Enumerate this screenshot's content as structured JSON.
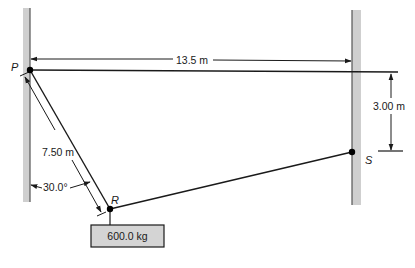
{
  "diagram": {
    "type": "statics-cable-system",
    "points": {
      "P": {
        "label": "P"
      },
      "R": {
        "label": "R"
      },
      "S": {
        "label": "S"
      }
    },
    "dimensions": {
      "wall_separation": "13.5 m",
      "vertical_offset": "3.00 m",
      "segment_PR_length": "7.50 m",
      "angle_PR_from_wall": "30.0°"
    },
    "mass": {
      "label": "600.0 kg"
    },
    "colors": {
      "wall_fill": "#cfcfcf",
      "wall_edge": "#555555",
      "line": "#1a1a1a",
      "mass_fill": "#d4d4d4"
    }
  }
}
